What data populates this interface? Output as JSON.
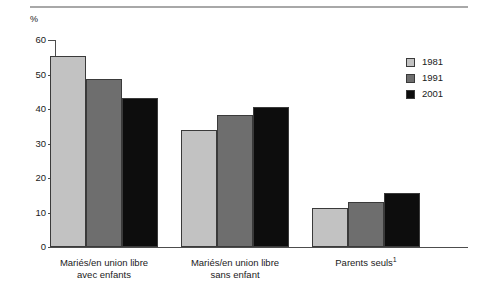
{
  "figure": {
    "unit_label": "%",
    "footnote_marker": "1"
  },
  "legend": {
    "position": "top-right",
    "entries": [
      {
        "label": "1981",
        "color": "#c2c2c2"
      },
      {
        "label": "1991",
        "color": "#6e6e6e"
      },
      {
        "label": "2001",
        "color": "#0d0d0d"
      }
    ]
  },
  "axis": {
    "y_ticks": [
      "0",
      "10",
      "20",
      "30",
      "40",
      "50",
      "60"
    ],
    "y_min": 0,
    "y_max": 60
  },
  "categories": [
    {
      "line1": "Mariés/en union libre",
      "line2": "avec enfants",
      "sup": ""
    },
    {
      "line1": "Mariés/en union libre",
      "line2": "sans enfant",
      "sup": ""
    },
    {
      "line1": "Parents seuls",
      "line2": "",
      "sup": "1"
    }
  ],
  "chart_data": {
    "type": "bar",
    "title": "",
    "xlabel": "",
    "ylabel": "%",
    "ylim": [
      0,
      60
    ],
    "grid": false,
    "legend_position": "top-right",
    "categories": [
      "Mariés/en union libre avec enfants",
      "Mariés/en union libre sans enfant",
      "Parents seuls¹"
    ],
    "series": [
      {
        "name": "1981",
        "color": "#c2c2c2",
        "values": [
          55.5,
          34.0,
          11.4
        ]
      },
      {
        "name": "1991",
        "color": "#6e6e6e",
        "values": [
          48.8,
          38.3,
          13.0
        ]
      },
      {
        "name": "2001",
        "color": "#0d0d0d",
        "values": [
          43.3,
          40.5,
          15.6
        ]
      }
    ]
  }
}
